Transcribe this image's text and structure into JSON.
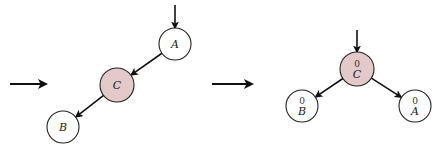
{
  "diagram": {
    "type": "avl-tree-rotation",
    "colors": {
      "highlight_fill": "#e3c9c9",
      "node_fill": "#ffffff",
      "stroke": "#222222"
    },
    "transition_arrows": [
      {
        "id": "left-transition",
        "x1": 10,
        "x2": 46,
        "y": 84
      },
      {
        "id": "middle-transition",
        "x1": 212,
        "x2": 252,
        "y": 84
      }
    ],
    "before": {
      "root_pointer": {
        "x": 175,
        "y1": 5,
        "y2": 28
      },
      "nodes": [
        {
          "id": "A",
          "label": "A",
          "cx": 175,
          "cy": 44,
          "r": 16,
          "highlight": false
        },
        {
          "id": "C",
          "label": "C",
          "cx": 117,
          "cy": 85,
          "r": 17,
          "highlight": true
        },
        {
          "id": "B",
          "label": "B",
          "cx": 63,
          "cy": 127,
          "r": 16,
          "highlight": false
        }
      ],
      "edges": [
        {
          "from": "A",
          "to": "C"
        },
        {
          "from": "C",
          "to": "B"
        }
      ]
    },
    "after": {
      "root_pointer": {
        "x": 357,
        "y1": 30,
        "y2": 52
      },
      "nodes": [
        {
          "id": "C",
          "label": "C",
          "balance": "0",
          "cx": 357,
          "cy": 69,
          "r": 17,
          "highlight": true
        },
        {
          "id": "B",
          "label": "B",
          "balance": "0",
          "cx": 302,
          "cy": 106,
          "r": 16,
          "highlight": false
        },
        {
          "id": "A",
          "label": "A",
          "balance": "0",
          "cx": 415,
          "cy": 106,
          "r": 16,
          "highlight": false
        }
      ],
      "edges": [
        {
          "from": "C",
          "to": "B"
        },
        {
          "from": "C",
          "to": "A"
        }
      ]
    }
  }
}
